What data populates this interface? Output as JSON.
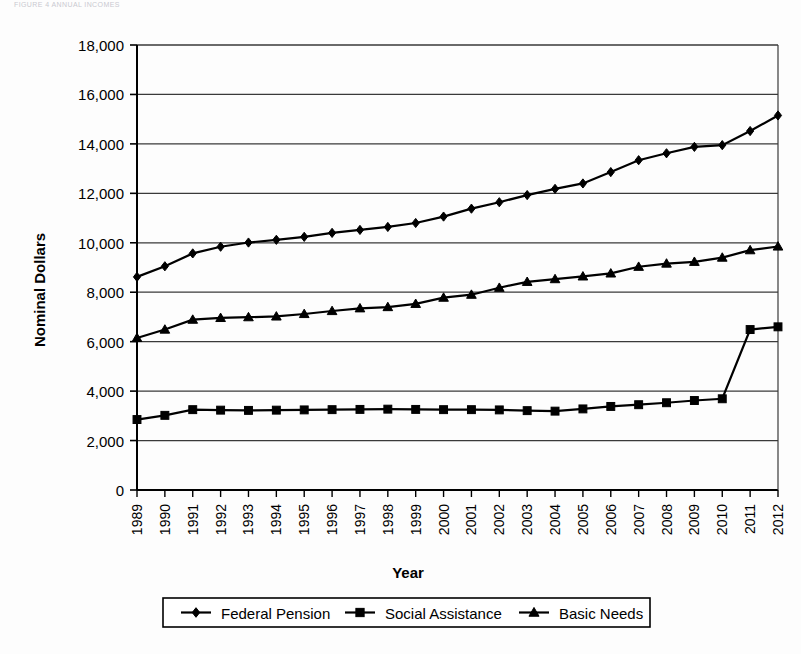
{
  "page": {
    "header_note": "FIGURE 4 ANNUAL INCOMES"
  },
  "chart_data": {
    "type": "line",
    "title": "",
    "xlabel": "Year",
    "ylabel": "Nominal Dollars",
    "grid": true,
    "legend_position": "bottom",
    "xlim": [
      1989,
      2012
    ],
    "ylim": [
      0,
      18000
    ],
    "ytick_step": 2000,
    "ytick_labels": [
      "0",
      "2,000",
      "4,000",
      "6,000",
      "8,000",
      "10,000",
      "12,000",
      "14,000",
      "16,000",
      "18,000"
    ],
    "ytick_values": [
      0,
      2000,
      4000,
      6000,
      8000,
      10000,
      12000,
      14000,
      16000,
      18000
    ],
    "categories": [
      "1989",
      "1990",
      "1991",
      "1992",
      "1993",
      "1994",
      "1995",
      "1996",
      "1997",
      "1998",
      "1999",
      "2000",
      "2001",
      "2002",
      "2003",
      "2004",
      "2005",
      "2006",
      "2007",
      "2008",
      "2009",
      "2010",
      "2011",
      "2012"
    ],
    "series": [
      {
        "name": "Federal Pension",
        "marker": "diamond",
        "color": "#000000",
        "values": [
          8620,
          9050,
          9570,
          9840,
          10010,
          10120,
          10240,
          10400,
          10520,
          10640,
          10800,
          11060,
          11380,
          11640,
          11930,
          12180,
          12400,
          12860,
          13340,
          13620,
          13880,
          13950,
          14520,
          15150
        ]
      },
      {
        "name": "Social Assistance",
        "marker": "square",
        "color": "#000000",
        "values": [
          2850,
          3020,
          3250,
          3230,
          3220,
          3230,
          3240,
          3250,
          3260,
          3270,
          3260,
          3250,
          3250,
          3240,
          3210,
          3190,
          3280,
          3380,
          3450,
          3530,
          3620,
          3690,
          6490,
          6600
        ]
      },
      {
        "name": "Basic Needs",
        "marker": "triangle",
        "color": "#000000",
        "values": [
          6150,
          6490,
          6890,
          6960,
          6990,
          7020,
          7120,
          7240,
          7350,
          7400,
          7530,
          7780,
          7900,
          8180,
          8420,
          8530,
          8640,
          8760,
          9030,
          9160,
          9230,
          9400,
          9700,
          9850
        ]
      }
    ]
  },
  "legend": {
    "items": [
      {
        "label": "Federal Pension",
        "marker": "diamond"
      },
      {
        "label": "Social Assistance",
        "marker": "square"
      },
      {
        "label": "Basic Needs",
        "marker": "triangle"
      }
    ]
  }
}
